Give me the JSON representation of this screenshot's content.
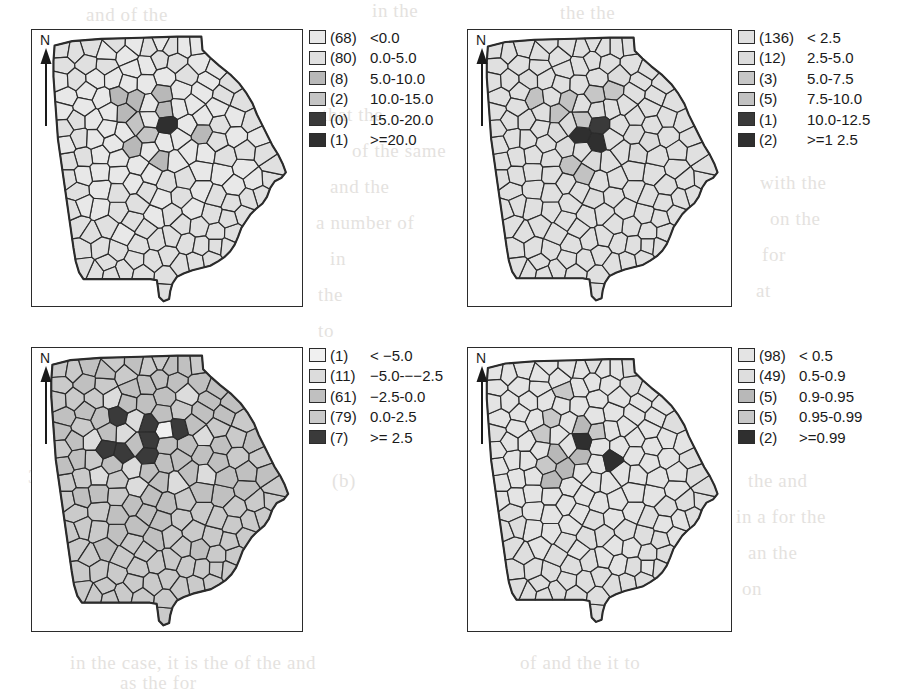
{
  "figure": {
    "kind": "four-panel-choropleth",
    "region": "Georgia counties",
    "north_label": "N"
  },
  "ghost_text": [
    {
      "text": "and of the",
      "x": 86,
      "y": 4
    },
    {
      "text": "in the",
      "x": 372,
      "y": 0
    },
    {
      "text": "the the",
      "x": 560,
      "y": 2
    },
    {
      "text": "that the",
      "x": 322,
      "y": 104
    },
    {
      "text": "of the same",
      "x": 352,
      "y": 140
    },
    {
      "text": "and the",
      "x": 330,
      "y": 176
    },
    {
      "text": "a number of",
      "x": 316,
      "y": 212
    },
    {
      "text": "in",
      "x": 330,
      "y": 248
    },
    {
      "text": "the",
      "x": 318,
      "y": 284
    },
    {
      "text": "to",
      "x": 318,
      "y": 320
    },
    {
      "text": "with the",
      "x": 760,
      "y": 172
    },
    {
      "text": "on the",
      "x": 770,
      "y": 208
    },
    {
      "text": "for",
      "x": 762,
      "y": 244
    },
    {
      "text": "at",
      "x": 756,
      "y": 280
    },
    {
      "text": "3:",
      "x": 30,
      "y": 430
    },
    {
      "text": "3:",
      "x": 28,
      "y": 466
    },
    {
      "text": "(b)",
      "x": 332,
      "y": 470
    },
    {
      "text": "the and",
      "x": 748,
      "y": 470
    },
    {
      "text": "in a for the",
      "x": 736,
      "y": 506
    },
    {
      "text": "an the",
      "x": 748,
      "y": 542
    },
    {
      "text": "on",
      "x": 742,
      "y": 578
    },
    {
      "text": "in the case, it is the of the and",
      "x": 70,
      "y": 652
    },
    {
      "text": "of and the it to",
      "x": 520,
      "y": 652
    },
    {
      "text": "as the for",
      "x": 120,
      "y": 672
    }
  ],
  "palette": {
    "fill_1": "#e8e8e8",
    "fill_2": "#dcdcdc",
    "fill_3": "#bdbdbd",
    "fill_4": "#c9c9c9",
    "fill_5": "#3a3a3a",
    "fill_6": "#2e2e2e",
    "outline": "#2b2b2b",
    "frame": "#2b2b2b",
    "background": "#ffffff"
  },
  "panels": [
    {
      "id": "panel-top-left",
      "legend": [
        {
          "count": "(68)",
          "range": "<0.0",
          "color": "#e8e8e8"
        },
        {
          "count": "(80)",
          "range": "0.0-5.0",
          "color": "#e0e0e0"
        },
        {
          "count": "(8)",
          "range": "5.0-10.0",
          "color": "#b8b8b8"
        },
        {
          "count": "(2)",
          "range": "10.0-15.0",
          "color": "#c4c4c4"
        },
        {
          "count": "(0)",
          "range": "15.0-20.0",
          "color": "#3a3a3a"
        },
        {
          "count": "(1)",
          "range": ">=20.0",
          "color": "#2f2f2f"
        }
      ]
    },
    {
      "id": "panel-top-right",
      "legend": [
        {
          "count": "(136)",
          "range": "< 2.5",
          "color": "#e0e0e0"
        },
        {
          "count": "(12)",
          "range": "2.5-5.0",
          "color": "#dcdcdc"
        },
        {
          "count": "(3)",
          "range": "5.0-7.5",
          "color": "#c6c6c6"
        },
        {
          "count": "(5)",
          "range": "7.5-10.0",
          "color": "#c2c2c2"
        },
        {
          "count": "(1)",
          "range": "10.0-12.5",
          "color": "#3a3a3a"
        },
        {
          "count": "(2)",
          "range": ">=1 2.5",
          "color": "#2f2f2f"
        }
      ]
    },
    {
      "id": "panel-bottom-left",
      "legend": [
        {
          "count": "(1)",
          "range": "< −5.0",
          "color": "#f0f0f0"
        },
        {
          "count": "(11)",
          "range": "−5.0-−−2.5",
          "color": "#dcdcdc"
        },
        {
          "count": "(61)",
          "range": "−2.5-0.0",
          "color": "#c0c0c0"
        },
        {
          "count": "(79)",
          "range": "0.0-2.5",
          "color": "#cacaca"
        },
        {
          "count": "(7)",
          "range": ">= 2.5",
          "color": "#3a3a3a"
        }
      ]
    },
    {
      "id": "panel-bottom-right",
      "legend": [
        {
          "count": "(98)",
          "range": "< 0.5",
          "color": "#e4e4e4"
        },
        {
          "count": "(49)",
          "range": "0.5-0.9",
          "color": "#dedede"
        },
        {
          "count": "(5)",
          "range": "0.9-0.95",
          "color": "#b8b8b8"
        },
        {
          "count": "(5)",
          "range": "0.95-0.99",
          "color": "#c8c8c8"
        },
        {
          "count": "(2)",
          "range": ">=0.99",
          "color": "#2f2f2f"
        }
      ]
    }
  ],
  "chart_data": {
    "type": "map",
    "subtype": "choropleth",
    "title": "",
    "geography": "Georgia, USA — counties (159)",
    "panel_count": 4,
    "maps": [
      {
        "name": "panel-top-left",
        "class_counts": [
          68,
          80,
          8,
          2,
          0,
          1
        ],
        "class_labels": [
          "<0.0",
          "0.0-5.0",
          "5.0-10.0",
          "10.0-15.0",
          "15.0-20.0",
          ">=20.0"
        ],
        "total": 159
      },
      {
        "name": "panel-top-right",
        "class_counts": [
          136,
          12,
          3,
          5,
          1,
          2
        ],
        "class_labels": [
          "< 2.5",
          "2.5-5.0",
          "5.0-7.5",
          "7.5-10.0",
          "10.0-12.5",
          ">=1 2.5"
        ],
        "total": 159
      },
      {
        "name": "panel-bottom-left",
        "class_counts": [
          1,
          11,
          61,
          79,
          7
        ],
        "class_labels": [
          "< −5.0",
          "−5.0-−−2.5",
          "−2.5-0.0",
          "0.0-2.5",
          ">= 2.5"
        ],
        "total": 159
      },
      {
        "name": "panel-bottom-right",
        "class_counts": [
          98,
          49,
          5,
          5,
          2
        ],
        "class_labels": [
          "< 0.5",
          "0.5-0.9",
          "0.9-0.95",
          "0.95-0.99",
          ">=0.99"
        ],
        "total": 159
      }
    ]
  }
}
